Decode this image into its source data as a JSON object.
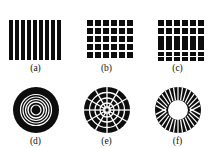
{
  "figure": {
    "background_color": "#ffffff",
    "ink_color": "#0d0d0d",
    "caption_color": "#111111",
    "rows": 2,
    "columns": 3
  },
  "panels": [
    {
      "id": "a",
      "caption": "(a)",
      "pattern_name": "vertical-stripes",
      "description": "vertical black bars on white",
      "stripe_count": 9,
      "stripe_width": 4,
      "stripe_gap": 2,
      "art_width": 56,
      "art_height": 42
    },
    {
      "id": "b",
      "caption": "(b)",
      "pattern_name": "square-grid",
      "description": "regular grid of black squares",
      "grid_rows": 6,
      "grid_cols": 6,
      "cell_size": 6,
      "cell_gap": 2,
      "art_width": 56,
      "art_height": 42
    },
    {
      "id": "c",
      "caption": "(c)",
      "pattern_name": "mixed-grid-bars",
      "description": "rows of squares above and below a band of tall vertical bars",
      "grid_cols": 6,
      "top_square_rows": 2,
      "bottom_square_rows": 2,
      "middle_bar_rows": 1,
      "cell_size": 6,
      "cell_gap": 2,
      "art_width": 56,
      "art_height": 42
    },
    {
      "id": "d",
      "caption": "(d)",
      "pattern_name": "concentric-rings",
      "description": "black disc with concentric white rings and dark core",
      "ring_count": 5,
      "outer_radius": 23,
      "core_radius": 5,
      "art_width": 48,
      "art_height": 48
    },
    {
      "id": "e",
      "caption": "(e)",
      "pattern_name": "polar-grid",
      "description": "black disc divided by white radial spokes and concentric rings",
      "spoke_count": 12,
      "ring_count": 4,
      "outer_radius": 23,
      "core_radius": 3,
      "art_width": 48,
      "art_height": 48
    },
    {
      "id": "f",
      "caption": "(f)",
      "pattern_name": "radial-annulus",
      "description": "black annulus with white radial spokes and a white central hole",
      "spoke_count": 32,
      "outer_radius": 23,
      "inner_radius": 10,
      "art_width": 48,
      "art_height": 48
    }
  ]
}
